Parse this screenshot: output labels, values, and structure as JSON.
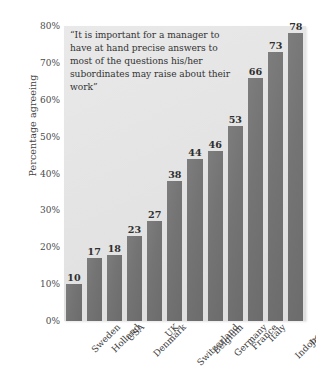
{
  "chart_data": {
    "type": "bar",
    "title": "",
    "subtitle": "",
    "annotation": "“It is important for a manager to have at hand precise answers to most of the questions his/her subordinates may raise about their work”",
    "xlabel": "",
    "ylabel": "Percentage agreeing",
    "ylim": [
      0,
      80
    ],
    "ytick_labels": [
      "80%",
      "70%",
      "60%",
      "50%",
      "40%",
      "30%",
      "20%",
      "10%",
      "0%"
    ],
    "ytick_values": [
      80,
      70,
      60,
      50,
      40,
      30,
      20,
      10,
      0
    ],
    "grid": false,
    "legend": false,
    "legend_position": "none",
    "value_labels": true,
    "categories": [
      "Sweden",
      "Holland",
      "USA",
      "Denmark",
      "UK",
      "Switzerland",
      "Belgium",
      "Germany",
      "France",
      "Italy",
      "Indonesia",
      "Japan"
    ],
    "values": [
      10,
      17,
      18,
      23,
      27,
      38,
      44,
      46,
      53,
      66,
      73,
      78
    ],
    "value_label_texts": [
      "10",
      "17",
      "18",
      "23",
      "27",
      "38",
      "44",
      "46",
      "53",
      "66",
      "73",
      "78"
    ],
    "colors": {
      "bar": "#747474",
      "plot_background": "#e4e4e4",
      "page_background": "#ffffff",
      "text": "#3b3b3b",
      "value_label": "#2f2f2f"
    }
  }
}
